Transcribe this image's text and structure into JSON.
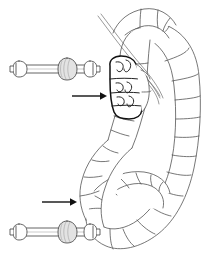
{
  "figure": {
    "background_color": "#ffffff",
    "ink_color": "#3a3a3a",
    "bold_ink_color": "#111111",
    "shade_color": "#e3e3e3",
    "width": 213,
    "height": 259,
    "caption": "",
    "style": "black-and-white line drawing"
  },
  "specimen": {
    "name": "segmented-larva",
    "label": "",
    "orientation": "coiled, head at upper-left, body curving right and down into a ventral coil",
    "segment_count_visible": 24,
    "regions": [
      {
        "name": "head-capsule",
        "label": "",
        "emphasis": "bold-outline",
        "segments": 4
      },
      {
        "name": "thorax",
        "label": "",
        "emphasis": "thin-outline",
        "segments": 5
      },
      {
        "name": "abdomen",
        "label": "",
        "emphasis": "thin-outline",
        "segments": 15
      },
      {
        "name": "setae",
        "label": "",
        "emphasis": "hairline",
        "count": 4
      }
    ]
  },
  "annotations": {
    "arrows": [
      {
        "name": "arrow-upper",
        "label": "",
        "points_to": "head-capsule",
        "direction": "right",
        "x1": 72,
        "y1": 96,
        "x2": 104,
        "y2": 96
      },
      {
        "name": "arrow-lower",
        "label": "",
        "points_to": "posterior-coil",
        "direction": "right",
        "x1": 42,
        "y1": 202,
        "x2": 74,
        "y2": 202
      }
    ]
  },
  "details": [
    {
      "name": "detail-upper-spicule",
      "label": "",
      "description": "dumbbell-shaped sclerite: shaft with terminal knob at each end and a large median knob",
      "knobs": 3,
      "x": 14,
      "y": 55,
      "width": 86,
      "height": 28
    },
    {
      "name": "detail-lower-spicule",
      "label": "",
      "description": "dumbbell-shaped sclerite: shaft with terminal knob at each end and a large median knob",
      "knobs": 3,
      "x": 14,
      "y": 218,
      "width": 86,
      "height": 28
    }
  ]
}
